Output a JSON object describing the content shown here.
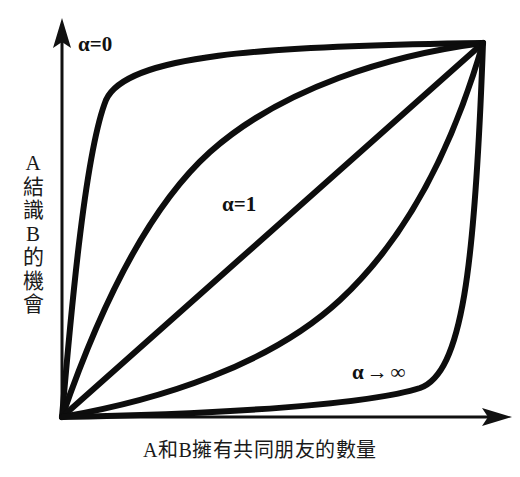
{
  "figure": {
    "background_color": "#ffffff",
    "ink_color": "#111111",
    "width": 520,
    "height": 477
  },
  "axes": {
    "y_axis_title_chars": [
      "A",
      "結",
      "識",
      "B",
      "的",
      "機",
      "會"
    ],
    "y_axis_title": "A結識B的機會",
    "x_axis_title": "A和B擁有共同朋友的數量",
    "origin": [
      62,
      417
    ],
    "y_axis_tip": [
      62,
      22
    ],
    "x_axis_tip": [
      510,
      417
    ]
  },
  "labels": {
    "alpha_zero": "α=0",
    "alpha_one": "α=1",
    "alpha_infinity_symbol": "α",
    "alpha_infinity_arrow": "→",
    "alpha_infinity_value": "∞"
  },
  "chart_data": {
    "type": "line",
    "title": "",
    "subtitle": "",
    "xlabel": "A和B擁有共同朋友的數量",
    "ylabel": "A結識B的機會",
    "xlim": [
      0,
      1
    ],
    "ylim": [
      0,
      1
    ],
    "grid": false,
    "legend": "inline-annotations",
    "axis_ticks": "none",
    "axis_style": "arrow-headed schematic axes",
    "annotations": [
      {
        "text": "α=0",
        "x": 0.06,
        "y": 0.97,
        "curve": "alpha-0"
      },
      {
        "text": "α=1",
        "x": 0.4,
        "y": 0.57,
        "curve": "alpha-1"
      },
      {
        "text": "α→∞",
        "x": 0.7,
        "y": 0.12,
        "curve": "alpha-infinity"
      }
    ],
    "series": [
      {
        "name": "α=0",
        "alpha": 0,
        "shape": "extreme concave",
        "x": [
          0.0,
          0.02,
          0.05,
          0.08,
          0.12,
          0.2,
          0.3,
          0.45,
          0.6,
          0.8,
          1.0
        ],
        "y": [
          0.0,
          0.55,
          0.78,
          0.88,
          0.925,
          0.955,
          0.972,
          0.984,
          0.991,
          0.997,
          1.0
        ],
        "path": "M 62 417 C 72 300 86 150 106 100 C 126 55 260 46 483 43"
      },
      {
        "name": "concave-mid",
        "alpha": 0.3,
        "shape": "concave",
        "x": [
          0.0,
          0.05,
          0.12,
          0.22,
          0.35,
          0.5,
          0.65,
          0.8,
          1.0
        ],
        "y": [
          0.0,
          0.31,
          0.5,
          0.66,
          0.79,
          0.88,
          0.94,
          0.975,
          1.0
        ],
        "path": "M 62 417 C 92 330 140 215 210 152 C 282 88 390 55 483 43"
      },
      {
        "name": "α=1",
        "alpha": 1,
        "shape": "straight diagonal",
        "x": [
          0.0,
          0.25,
          0.5,
          0.75,
          1.0
        ],
        "y": [
          0.0,
          0.25,
          0.5,
          0.75,
          1.0
        ],
        "path": "M 62 417 L 483 43"
      },
      {
        "name": "convex-mid",
        "alpha": 3,
        "shape": "convex",
        "x": [
          0.0,
          0.2,
          0.35,
          0.5,
          0.65,
          0.78,
          0.88,
          0.95,
          1.0
        ],
        "y": [
          0.0,
          0.025,
          0.06,
          0.12,
          0.21,
          0.34,
          0.5,
          0.69,
          1.0
        ],
        "path": "M 62 417 C 160 400 270 365 340 300 C 410 235 455 140 483 43"
      },
      {
        "name": "α→∞",
        "alpha": "infinity",
        "shape": "extreme convex",
        "x": [
          0.0,
          0.2,
          0.4,
          0.6,
          0.75,
          0.85,
          0.92,
          0.96,
          1.0
        ],
        "y": [
          0.0,
          0.003,
          0.009,
          0.02,
          0.045,
          0.09,
          0.2,
          0.45,
          1.0
        ],
        "path": "M 62 417 C 230 414 370 404 420 388 C 462 373 475 270 483 43"
      }
    ]
  }
}
